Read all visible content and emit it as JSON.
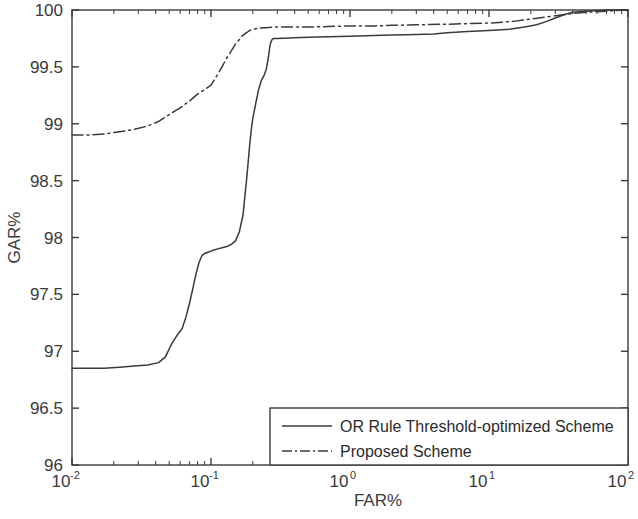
{
  "chart_data": {
    "type": "line",
    "title": "",
    "xlabel": "FAR%",
    "ylabel": "GAR%",
    "xscale": "log",
    "yscale": "linear",
    "xlim": [
      0.01,
      100
    ],
    "ylim": [
      96,
      100
    ],
    "grid": false,
    "legend_position": "bottom-right",
    "x_tick_labels": [
      "10-2",
      "10-1",
      "100",
      "101",
      "102"
    ],
    "x_tick_bases": [
      "10",
      "10",
      "10",
      "10",
      "10"
    ],
    "x_tick_exponents": [
      "-2",
      "-1",
      "0",
      "1",
      "2"
    ],
    "x_tick_values": [
      0.01,
      0.1,
      1,
      10,
      100
    ],
    "y_tick_labels": [
      "96",
      "96.5",
      "97",
      "97.5",
      "98",
      "98.5",
      "99",
      "99.5",
      "100"
    ],
    "y_tick_values": [
      96,
      96.5,
      97,
      97.5,
      98,
      98.5,
      99,
      99.5,
      100
    ],
    "series": [
      {
        "name": "OR Rule Threshold-optimized Scheme",
        "style": "solid",
        "color": "#3a3a3a",
        "x": [
          0.01,
          0.013,
          0.017,
          0.022,
          0.028,
          0.035,
          0.042,
          0.047,
          0.05,
          0.053,
          0.057,
          0.062,
          0.066,
          0.07,
          0.074,
          0.078,
          0.082,
          0.086,
          0.09,
          0.095,
          0.1,
          0.105,
          0.112,
          0.12,
          0.13,
          0.14,
          0.15,
          0.16,
          0.17,
          0.175,
          0.18,
          0.185,
          0.19,
          0.195,
          0.2,
          0.21,
          0.22,
          0.23,
          0.24,
          0.25,
          0.26,
          0.265,
          0.27,
          0.275,
          0.28,
          0.3,
          0.4,
          0.5,
          0.7,
          1.0,
          1.5,
          2.0,
          3.0,
          4.0,
          5.0,
          7.0,
          10.0,
          14.0,
          18.0,
          22.0,
          26.0,
          30.0,
          35.0,
          40.0,
          50.0,
          70.0,
          100.0
        ],
        "y": [
          96.85,
          96.85,
          96.85,
          96.86,
          96.87,
          96.88,
          96.9,
          96.95,
          97.02,
          97.08,
          97.14,
          97.2,
          97.3,
          97.42,
          97.55,
          97.68,
          97.78,
          97.84,
          97.86,
          97.87,
          97.88,
          97.89,
          97.9,
          97.91,
          97.92,
          97.94,
          97.97,
          98.05,
          98.2,
          98.35,
          98.5,
          98.66,
          98.82,
          98.95,
          99.05,
          99.18,
          99.3,
          99.38,
          99.42,
          99.48,
          99.6,
          99.68,
          99.72,
          99.74,
          99.75,
          99.75,
          99.755,
          99.76,
          99.765,
          99.77,
          99.775,
          99.78,
          99.785,
          99.79,
          99.8,
          99.81,
          99.82,
          99.83,
          99.85,
          99.87,
          99.9,
          99.93,
          99.96,
          99.98,
          99.99,
          100.0,
          100.0
        ],
        "description": "Solid line. Flat near 96.85 from 0.01 to ~0.045 FAR%, rises to a ~97.9 plateau between 0.08 and 0.16, then a steep climb to ~99.75 at 0.28, then a slow rise converging to 100 near 40 FAR%."
      },
      {
        "name": "Proposed Scheme",
        "style": "dash-dot",
        "color": "#3a3a3a",
        "x": [
          0.01,
          0.013,
          0.017,
          0.022,
          0.028,
          0.035,
          0.042,
          0.05,
          0.06,
          0.07,
          0.08,
          0.09,
          0.1,
          0.11,
          0.12,
          0.13,
          0.14,
          0.15,
          0.16,
          0.17,
          0.18,
          0.19,
          0.2,
          0.22,
          0.25,
          0.28,
          0.3,
          0.35,
          0.4,
          0.5,
          0.7,
          1.0,
          1.5,
          2.0,
          3.0,
          5.0,
          7.0,
          10.0,
          15.0,
          20.0,
          30.0,
          40.0,
          50.0,
          70.0,
          100.0
        ],
        "y": [
          98.9,
          98.9,
          98.91,
          98.93,
          98.95,
          98.98,
          99.02,
          99.08,
          99.14,
          99.2,
          99.26,
          99.3,
          99.34,
          99.42,
          99.5,
          99.58,
          99.64,
          99.7,
          99.74,
          99.78,
          99.8,
          99.82,
          99.83,
          99.84,
          99.845,
          99.85,
          99.85,
          99.85,
          99.85,
          99.85,
          99.855,
          99.86,
          99.86,
          99.865,
          99.87,
          99.875,
          99.88,
          99.885,
          99.9,
          99.92,
          99.95,
          99.97,
          99.98,
          99.99,
          100.0
        ],
        "description": "Dash-dot line. Starts at ~98.9 at FAR 0.01, rises steadily to ~99.85 by FAR 0.25, then nearly flat, converging to 100 at the right edge."
      }
    ]
  },
  "legend": {
    "entries": [
      {
        "label": "OR Rule Threshold-optimized Scheme",
        "style": "solid"
      },
      {
        "label": "Proposed Scheme",
        "style": "dash-dot"
      }
    ]
  },
  "axes": {
    "x_title": "FAR%",
    "y_title": "GAR%"
  }
}
